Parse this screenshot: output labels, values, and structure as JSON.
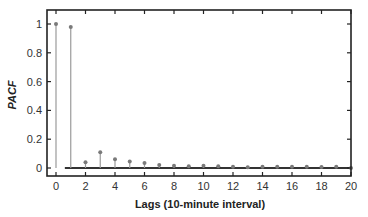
{
  "chart_data": {
    "type": "stem",
    "title": "",
    "xlabel": "Lags (10-minute interval)",
    "ylabel": "PACF",
    "xlim": [
      -0.6,
      20
    ],
    "ylim": [
      -0.05,
      1.1
    ],
    "x_ticks": [
      0,
      2,
      4,
      6,
      8,
      10,
      12,
      14,
      16,
      18,
      20
    ],
    "y_ticks": [
      0,
      0.2,
      0.4,
      0.6,
      0.8,
      1
    ],
    "y_tick_labels": [
      "0",
      "0.2",
      "0.4",
      "0.6",
      "0.8",
      "1"
    ],
    "grid": false,
    "legend": null,
    "x": [
      0,
      1,
      2,
      3,
      4,
      5,
      6,
      7,
      8,
      9,
      10,
      11,
      12,
      13,
      14,
      15,
      16,
      17,
      18,
      19,
      20
    ],
    "values": [
      1.0,
      0.98,
      0.04,
      0.11,
      0.06,
      0.045,
      0.035,
      0.02,
      0.015,
      0.012,
      0.015,
      0.012,
      0.008,
      0.006,
      0.008,
      0.008,
      0.008,
      0.008,
      0.007,
      0.008,
      0.0
    ],
    "colors": {
      "stem": "#9a9a9a",
      "marker": "#7a7a7a",
      "axis": "#222222",
      "baseline": "#333333"
    }
  }
}
